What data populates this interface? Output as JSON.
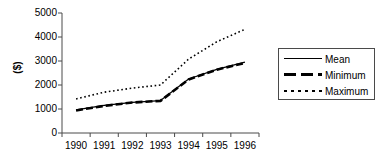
{
  "chart_data": {
    "type": "line",
    "title": "",
    "xlabel": "",
    "ylabel": "($)",
    "categories": [
      "1990",
      "1991",
      "1992",
      "1993",
      "1994",
      "1995",
      "1996"
    ],
    "ylim": [
      0,
      5000
    ],
    "yticks": [
      0,
      1000,
      2000,
      3000,
      4000,
      5000
    ],
    "ytick_labels": [
      "0",
      "1000",
      "2000",
      "3000",
      "4000",
      "5000"
    ],
    "grid": false,
    "legend_position": "right",
    "series": [
      {
        "name": "Mean",
        "style": "solid-thin",
        "values": [
          960,
          1150,
          1280,
          1350,
          2250,
          2650,
          2950
        ]
      },
      {
        "name": "Minimum",
        "style": "dashed-thick",
        "values": [
          940,
          1130,
          1270,
          1340,
          2230,
          2640,
          2920
        ]
      },
      {
        "name": "Maximum",
        "style": "dotted",
        "values": [
          1420,
          1700,
          1870,
          2000,
          3080,
          3800,
          4320
        ]
      }
    ]
  },
  "axis": {
    "y_title": "($)"
  },
  "legend": {
    "entries": [
      {
        "label": "Mean"
      },
      {
        "label": "Minimum"
      },
      {
        "label": "Maximum"
      }
    ]
  },
  "colors": {
    "line": "#000000",
    "axis": "#4a4a4a",
    "background": "#ffffff"
  }
}
